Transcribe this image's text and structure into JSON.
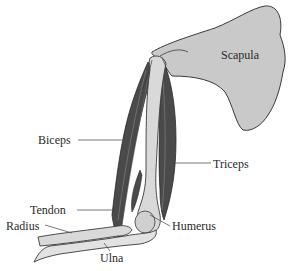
{
  "diagram": {
    "labels": {
      "scapula": "Scapula",
      "biceps": "Biceps",
      "triceps": "Triceps",
      "tendon": "Tendon",
      "humerus": "Humerus",
      "radius": "Radius",
      "ulna": "Ulna"
    },
    "colors": {
      "bone": "#d9d9d9",
      "scapula": "#c9c9c9",
      "muscle": "#4a4a4a",
      "outline": "#3a3a3a",
      "text": "#2a2a2a"
    }
  }
}
